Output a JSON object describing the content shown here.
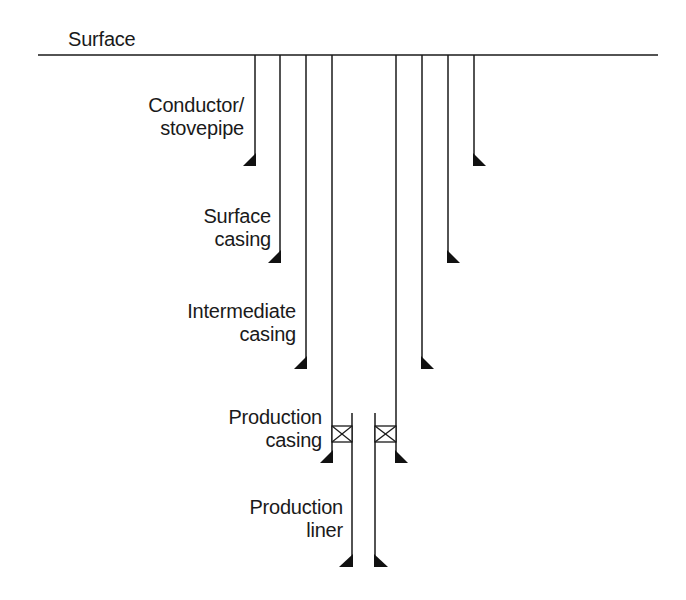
{
  "diagram": {
    "type": "well casing schematic",
    "surface_label": "Surface",
    "colors": {
      "line": "#1a1a1a",
      "background": "#ffffff"
    },
    "strings": [
      {
        "id": "conductor",
        "label_lines": [
          "Conductor/",
          "stovepipe"
        ]
      },
      {
        "id": "surface-casing",
        "label_lines": [
          "Surface",
          "casing"
        ]
      },
      {
        "id": "intermediate-casing",
        "label_lines": [
          "Intermediate",
          "casing"
        ]
      },
      {
        "id": "production-casing",
        "label_lines": [
          "Production",
          "casing"
        ]
      },
      {
        "id": "production-liner",
        "label_lines": [
          "Production",
          "liner"
        ]
      }
    ]
  }
}
